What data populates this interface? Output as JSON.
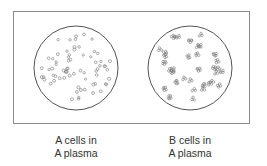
{
  "diagram": {
    "type": "blood-agglutination-comparison",
    "panels": [
      {
        "id": "left",
        "line1": "A cells in",
        "line2": "A plasma",
        "state": "no agglutination",
        "cell_pattern": "dispersed single cells"
      },
      {
        "id": "right",
        "line1": "B cells in",
        "line2": "A plasma",
        "state": "agglutination",
        "cell_pattern": "clumped cell clusters"
      }
    ],
    "colors": {
      "outline": "#555555",
      "frame": "#8a8a8a",
      "cell": "#777777",
      "text": "#333333"
    }
  }
}
